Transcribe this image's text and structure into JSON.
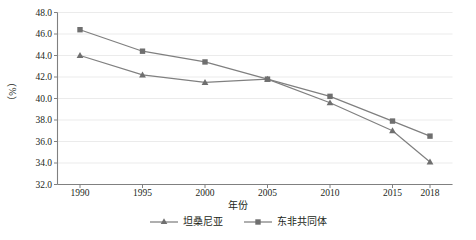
{
  "chart_data": {
    "type": "line",
    "title": "",
    "xlabel": "年份",
    "ylabel": "（%）",
    "x": [
      1990,
      1995,
      2000,
      2005,
      2010,
      2015,
      2018
    ],
    "xticklabels": [
      "1990",
      "1995",
      "2000",
      "2005",
      "2010",
      "2015",
      "2018"
    ],
    "yticklabels": [
      "48.0",
      "46.0",
      "44.0",
      "42.0",
      "40.0",
      "38.0",
      "36.0",
      "34.0",
      "32.0"
    ],
    "yticks": [
      48.0,
      46.0,
      44.0,
      42.0,
      40.0,
      38.0,
      36.0,
      34.0,
      32.0
    ],
    "ylim": [
      32.0,
      48.0
    ],
    "xlim": [
      1988.2,
      2019.8
    ],
    "grid": "horizontal",
    "legend_position": "bottom-center",
    "series": [
      {
        "name": "坦桑尼亚",
        "marker": "triangle",
        "color": "#808080",
        "values": [
          44.0,
          42.2,
          41.5,
          41.8,
          39.6,
          37.0,
          34.1
        ]
      },
      {
        "name": "东非共同体",
        "marker": "square",
        "color": "#7f7f7f",
        "values": [
          46.4,
          44.4,
          43.4,
          41.8,
          40.2,
          37.9,
          36.5
        ]
      }
    ],
    "colors": {
      "axis": "#808080",
      "grid": "#e6e6e6",
      "line": "#7a7a7a",
      "text": "#231f20"
    }
  }
}
